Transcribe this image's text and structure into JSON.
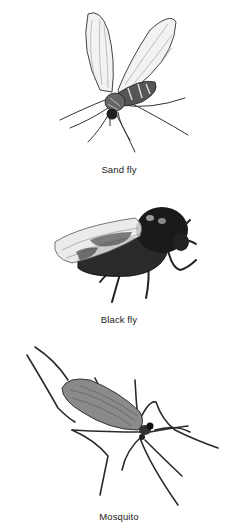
{
  "figures": [
    {
      "caption": "Sand fly",
      "icon": "sand-fly-illustration"
    },
    {
      "caption": "Black fly",
      "icon": "black-fly-illustration"
    },
    {
      "caption": "Mosquito",
      "icon": "mosquito-illustration"
    }
  ]
}
